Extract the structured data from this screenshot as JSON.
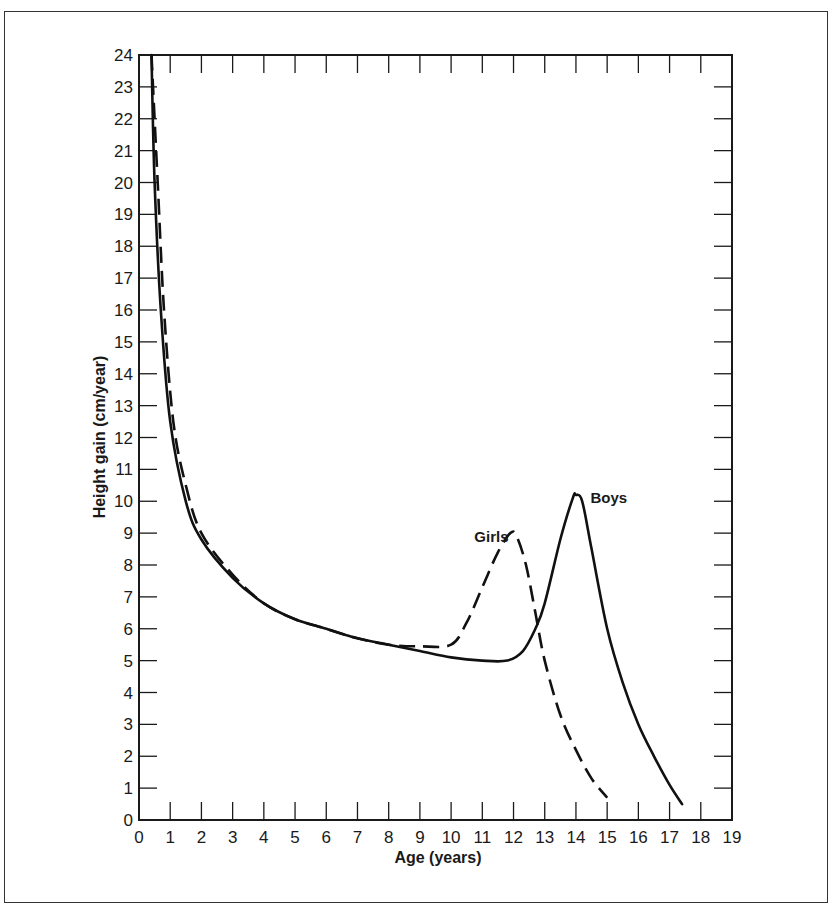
{
  "chart_data": {
    "type": "line",
    "title": "",
    "xlabel": "Age (years)",
    "ylabel": "Height gain (cm/year)",
    "xlim": [
      0,
      19
    ],
    "ylim": [
      0,
      24
    ],
    "x_ticks": [
      0,
      1,
      2,
      3,
      4,
      5,
      6,
      7,
      8,
      9,
      10,
      11,
      12,
      13,
      14,
      15,
      16,
      17,
      18,
      19
    ],
    "y_ticks": [
      0,
      1,
      2,
      3,
      4,
      5,
      6,
      7,
      8,
      9,
      10,
      11,
      12,
      13,
      14,
      15,
      16,
      17,
      18,
      19,
      20,
      21,
      22,
      23,
      24
    ],
    "grid": false,
    "legend": "inline labels",
    "series": [
      {
        "name": "Boys",
        "style": "solid",
        "points": [
          [
            0.4,
            24
          ],
          [
            0.5,
            20
          ],
          [
            0.7,
            16
          ],
          [
            1.0,
            12.5
          ],
          [
            1.5,
            10.0
          ],
          [
            2.0,
            8.8
          ],
          [
            3.0,
            7.6
          ],
          [
            4.0,
            6.8
          ],
          [
            5.0,
            6.3
          ],
          [
            6.0,
            6.0
          ],
          [
            7.0,
            5.7
          ],
          [
            8.0,
            5.5
          ],
          [
            9.0,
            5.3
          ],
          [
            10.0,
            5.1
          ],
          [
            11.0,
            5.0
          ],
          [
            11.8,
            5.0
          ],
          [
            12.3,
            5.3
          ],
          [
            12.7,
            6.0
          ],
          [
            13.0,
            6.8
          ],
          [
            13.5,
            8.8
          ],
          [
            13.9,
            10.1
          ],
          [
            14.0,
            10.2
          ],
          [
            14.2,
            10.0
          ],
          [
            14.5,
            8.5
          ],
          [
            15.0,
            6.0
          ],
          [
            15.5,
            4.3
          ],
          [
            16.0,
            3.0
          ],
          [
            16.5,
            2.0
          ],
          [
            17.0,
            1.1
          ],
          [
            17.4,
            0.5
          ]
        ]
      },
      {
        "name": "Girls",
        "style": "dashed",
        "points": [
          [
            0.4,
            24
          ],
          [
            0.6,
            20
          ],
          [
            0.8,
            16
          ],
          [
            1.1,
            12.5
          ],
          [
            1.5,
            10.5
          ],
          [
            2.0,
            9.0
          ],
          [
            3.0,
            7.7
          ],
          [
            4.0,
            6.8
          ],
          [
            5.0,
            6.3
          ],
          [
            6.0,
            6.0
          ],
          [
            7.0,
            5.7
          ],
          [
            8.0,
            5.5
          ],
          [
            9.0,
            5.45
          ],
          [
            10.0,
            5.5
          ],
          [
            10.5,
            6.2
          ],
          [
            11.0,
            7.3
          ],
          [
            11.5,
            8.4
          ],
          [
            11.9,
            9.0
          ],
          [
            12.1,
            8.9
          ],
          [
            12.4,
            8.0
          ],
          [
            12.7,
            6.5
          ],
          [
            13.0,
            5.0
          ],
          [
            13.5,
            3.3
          ],
          [
            14.0,
            2.2
          ],
          [
            14.5,
            1.3
          ],
          [
            15.0,
            0.7
          ]
        ]
      }
    ],
    "annotations": [
      {
        "text": "Girls",
        "x": 11.0,
        "y": 8.9
      },
      {
        "text": "Boys",
        "x": 14.4,
        "y": 10.2
      }
    ]
  },
  "labels": {
    "xlabel": "Age (years)",
    "ylabel": "Height gain (cm/year)",
    "girls": "Girls",
    "boys": "Boys"
  }
}
